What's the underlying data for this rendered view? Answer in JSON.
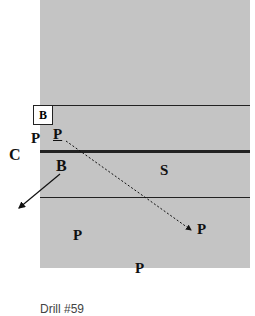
{
  "diagram": {
    "type": "drill-diagram",
    "field_color": "#c4c4c4",
    "labels": {
      "box_b": "B",
      "p_left": "P",
      "p_underlined": "P",
      "c_left": "C",
      "b_mid": "B",
      "s": "S",
      "p_right": "P",
      "p_lower_left": "P",
      "p_lower_mid": "P"
    },
    "lines": {
      "top_thin": 105,
      "middle_thick": 151,
      "bottom_thin": 198
    },
    "arrows": [
      {
        "from": "B",
        "to": "off-field-left",
        "style": "solid"
      },
      {
        "from": "P",
        "to": "P",
        "style": "dashed"
      }
    ],
    "caption": "Drill #59"
  }
}
